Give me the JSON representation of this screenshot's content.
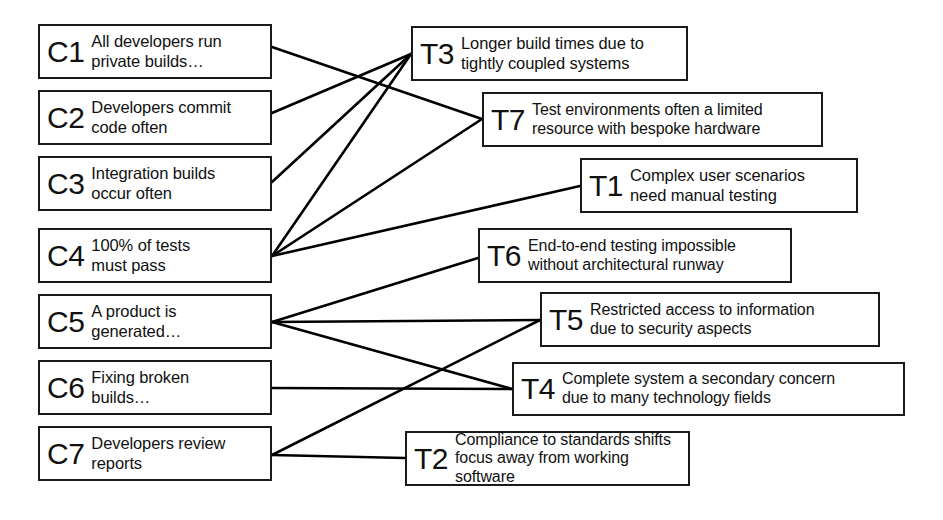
{
  "diagram": {
    "style": {
      "box_border_color": "#1a1a1a",
      "edge_color": "#000000",
      "background_color": "#ffffff"
    },
    "left_column_label": "Practices (C)",
    "right_column_label": "Challenges (T)",
    "left_nodes": [
      {
        "id": "C1",
        "code": "C1",
        "text": "All developers run\nprivate builds…",
        "x": 38,
        "y": 24,
        "w": 234,
        "h": 55
      },
      {
        "id": "C2",
        "code": "C2",
        "text": "Developers commit\ncode often",
        "x": 38,
        "y": 90,
        "w": 234,
        "h": 55
      },
      {
        "id": "C3",
        "code": "C3",
        "text": "Integration builds\noccur often",
        "x": 38,
        "y": 156,
        "w": 234,
        "h": 55
      },
      {
        "id": "C4",
        "code": "C4",
        "text": "100% of tests\nmust pass",
        "x": 38,
        "y": 228,
        "w": 234,
        "h": 55
      },
      {
        "id": "C5",
        "code": "C5",
        "text": "A product is\ngenerated…",
        "x": 38,
        "y": 294,
        "w": 234,
        "h": 55
      },
      {
        "id": "C6",
        "code": "C6",
        "text": "Fixing broken\nbuilds…",
        "x": 38,
        "y": 360,
        "w": 234,
        "h": 55
      },
      {
        "id": "C7",
        "code": "C7",
        "text": "Developers review\nreports",
        "x": 38,
        "y": 426,
        "w": 234,
        "h": 55
      }
    ],
    "right_nodes": [
      {
        "id": "T3",
        "code": "T3",
        "text": "Longer build times due to\ntightly coupled systems",
        "x": 411,
        "y": 26,
        "w": 277,
        "h": 55
      },
      {
        "id": "T7",
        "code": "T7",
        "text": "Test environments often a limited\nresource with bespoke hardware",
        "x": 482,
        "y": 92,
        "w": 341,
        "h": 55
      },
      {
        "id": "T1",
        "code": "T1",
        "text": "Complex user scenarios\nneed manual testing",
        "x": 580,
        "y": 158,
        "w": 278,
        "h": 55
      },
      {
        "id": "T6",
        "code": "T6",
        "text": "End-to-end testing impossible\nwithout architectural runway",
        "x": 478,
        "y": 228,
        "w": 314,
        "h": 55
      },
      {
        "id": "T5",
        "code": "T5",
        "text": "Restricted access to information\ndue to security aspects",
        "x": 540,
        "y": 292,
        "w": 340,
        "h": 55
      },
      {
        "id": "T4",
        "code": "T4",
        "text": "Complete system a secondary concern\ndue to many technology fields",
        "x": 512,
        "y": 362,
        "w": 393,
        "h": 54
      },
      {
        "id": "T2",
        "code": "T2",
        "text": "Compliance to standards shifts\nfocus away from working software",
        "x": 405,
        "y": 431,
        "w": 285,
        "h": 55
      }
    ],
    "edges": [
      {
        "from": "C1",
        "to": "T7",
        "x1": 272,
        "y1": 47,
        "x2": 482,
        "y2": 119
      },
      {
        "from": "C2",
        "to": "T3",
        "x1": 272,
        "y1": 113,
        "x2": 411,
        "y2": 54
      },
      {
        "from": "C3",
        "to": "T3",
        "x1": 272,
        "y1": 182,
        "x2": 411,
        "y2": 54
      },
      {
        "from": "C4",
        "to": "T3",
        "x1": 272,
        "y1": 256,
        "x2": 411,
        "y2": 54
      },
      {
        "from": "C4",
        "to": "T7",
        "x1": 272,
        "y1": 256,
        "x2": 482,
        "y2": 119
      },
      {
        "from": "C4",
        "to": "T1",
        "x1": 272,
        "y1": 256,
        "x2": 580,
        "y2": 186
      },
      {
        "from": "C5",
        "to": "T6",
        "x1": 272,
        "y1": 322,
        "x2": 478,
        "y2": 258
      },
      {
        "from": "C5",
        "to": "T5",
        "x1": 272,
        "y1": 322,
        "x2": 540,
        "y2": 320
      },
      {
        "from": "C5",
        "to": "T4",
        "x1": 272,
        "y1": 322,
        "x2": 512,
        "y2": 389
      },
      {
        "from": "C6",
        "to": "T4",
        "x1": 272,
        "y1": 388,
        "x2": 512,
        "y2": 389
      },
      {
        "from": "C7",
        "to": "T5",
        "x1": 272,
        "y1": 455,
        "x2": 540,
        "y2": 320
      },
      {
        "from": "C7",
        "to": "T2",
        "x1": 272,
        "y1": 455,
        "x2": 405,
        "y2": 458
      }
    ]
  }
}
